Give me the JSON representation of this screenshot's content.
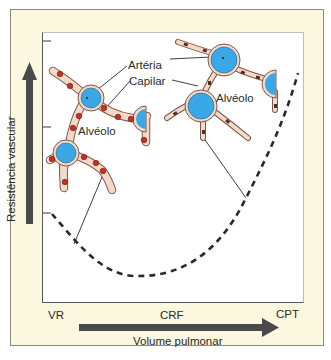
{
  "diagram": {
    "y_axis": {
      "label": "Resistência vascular",
      "arrow_direction": "up"
    },
    "x_axis": {
      "label": "Volume pulmonar",
      "arrow_direction": "right",
      "ticks": [
        "VR",
        "CRF",
        "CPT"
      ]
    },
    "annotations": {
      "arteria": "Artéria",
      "capilar": "Capilar",
      "alveolo_left": "Alvéolo",
      "alveolo_right": "Alvéolo"
    },
    "insets": [
      {
        "name": "low-volume-inset",
        "description": "Vasos extra-alveolares estreitos, capilares abertos (volume baixo)"
      },
      {
        "name": "high-volume-inset",
        "description": "Vasos extra-alveolares dilatados, capilares comprimidos (volume alto)"
      }
    ],
    "curve": {
      "style": "dashed",
      "shape": "U-shaped",
      "minimum_at": "CRF"
    },
    "colors": {
      "frame_bg": "#fbf8df",
      "plot_bg": "#ffffff",
      "arrow": "#4a4a4c",
      "vessel_fill": "#f5d9c8",
      "vessel_stroke": "#7a5a4a",
      "artery_fill": "#3aa7e6",
      "capillary_red": "#c8301e",
      "capillary_dark": "#5a2a20",
      "curve": "#2a2a2a"
    }
  }
}
